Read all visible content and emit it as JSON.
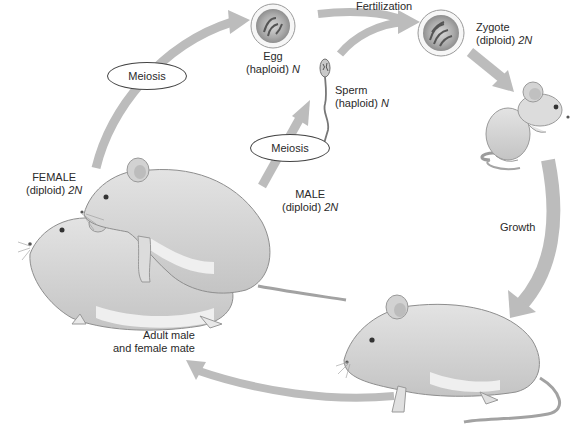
{
  "colors": {
    "arrow": "#b9b9b9",
    "fur": "#dcdcdc",
    "fur_shadow": "#bdbdbd",
    "belly": "#efefef",
    "outline": "#8a8a8a",
    "text": "#2a2a2a"
  },
  "stages": {
    "egg": {
      "name": "Egg",
      "ploidy": "(haploid)",
      "n": "N"
    },
    "sperm": {
      "name": "Sperm",
      "ploidy": "(haploid)",
      "n": "N"
    },
    "zygote": {
      "name": "Zygote",
      "ploidy": "(diploid)",
      "n": "2N"
    },
    "female": {
      "name": "FEMALE",
      "ploidy": "(diploid)",
      "n": "2N"
    },
    "male": {
      "name": "MALE",
      "ploidy": "(diploid)",
      "n": "2N"
    },
    "mate": {
      "line1": "Adult male",
      "line2": "and female mate"
    }
  },
  "processes": {
    "fertilization": "Fertilization",
    "meiosis_female": "Meiosis",
    "meiosis_male": "Meiosis",
    "growth": "Growth"
  }
}
